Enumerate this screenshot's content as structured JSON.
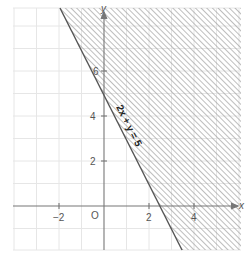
{
  "diagram": {
    "type": "linear-inequality-graph",
    "boundary_equation": "2x + y = 5",
    "shaded_region": "2x + y ≥ 5",
    "shading_style": "diagonal-hatch",
    "axes": {
      "x_label": "x",
      "y_label": "y",
      "origin_label": "O",
      "x_ticks": [
        "−2",
        "2",
        "4"
      ],
      "y_ticks": [
        "2",
        "4",
        "6"
      ],
      "x_range": [
        -4,
        6
      ],
      "y_range": [
        -2,
        8.8
      ]
    },
    "colors": {
      "grid": "#e6e6e6",
      "axis": "#777777",
      "boundary_line": "#555555",
      "hatch": "#9a9a9a"
    }
  }
}
